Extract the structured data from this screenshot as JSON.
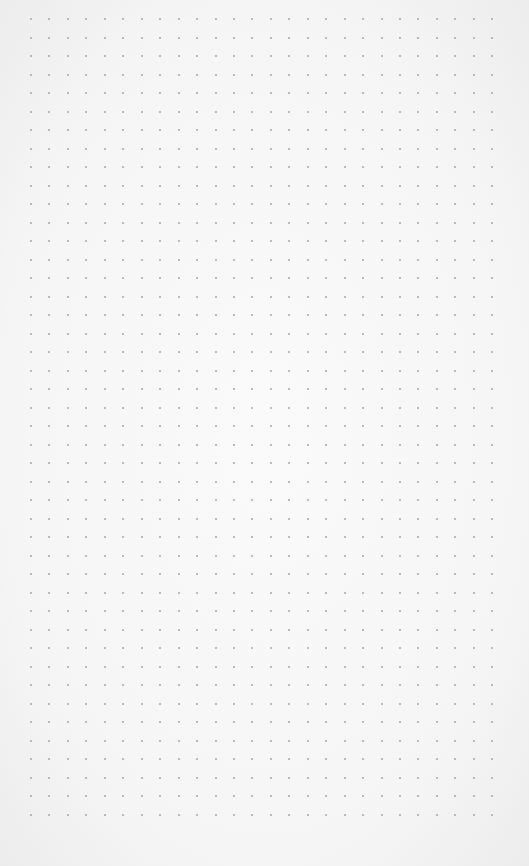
{
  "paper": {
    "type": "dot-grid",
    "background_color": "#f6f6f6",
    "dot_color": "#a6a6a6",
    "grid": {
      "columns": 26,
      "rows": 44,
      "origin_x": 31,
      "origin_y": 19,
      "spacing_x": 18.45,
      "spacing_y": 18.5
    }
  }
}
